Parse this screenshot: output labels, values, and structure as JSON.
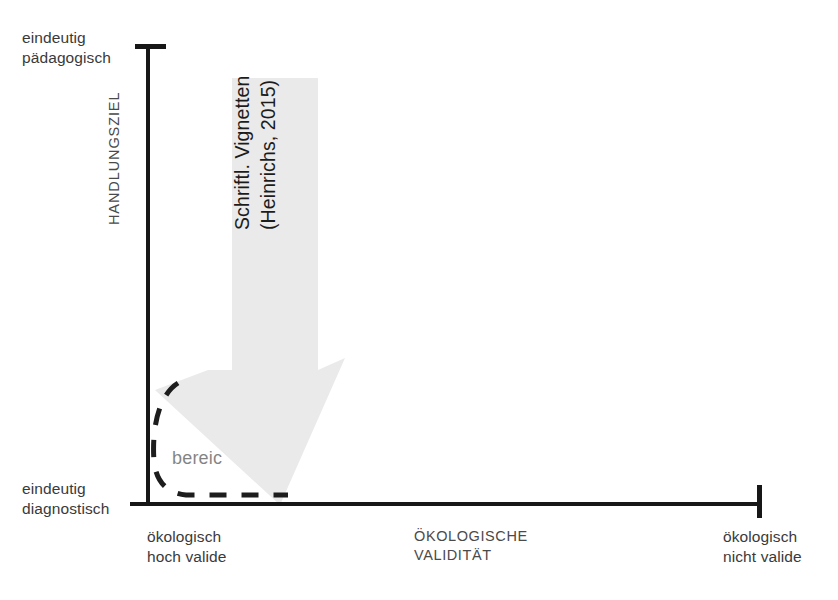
{
  "figure": {
    "type": "conceptual-quadrant-diagram",
    "language": "de"
  },
  "axes": {
    "y": {
      "title": "HANDLUNGSZIEL",
      "top_label": "eindeutig\npädagogisch",
      "bottom_label": "eindeutig\ndiagnostisch"
    },
    "x": {
      "title": "ÖKOLOGISCHE\nVALIDITÄT",
      "left_label": "ökologisch\nhoch valide",
      "right_label": "ökologisch\nnicht valide"
    }
  },
  "arrow": {
    "label": "Schriftl. Vignetten\n(Heinrichs, 2015)",
    "fill_color": "#eaeaea",
    "direction": "down-left"
  },
  "dashed_region": {
    "label": "bereic",
    "stroke_color": "#1d1d1d",
    "style": "dashed"
  },
  "colors": {
    "axis": "#171717",
    "text": "#3a3a3a",
    "background": "#ffffff"
  }
}
